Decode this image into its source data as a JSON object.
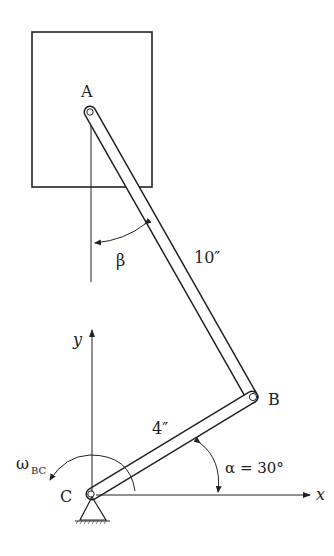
{
  "diagram": {
    "type": "mechanism",
    "points": {
      "A": {
        "label": "A"
      },
      "B": {
        "label": "B"
      },
      "C": {
        "label": "C"
      }
    },
    "links": {
      "AB": {
        "length_label": "10″"
      },
      "BC": {
        "length_label": "4″"
      }
    },
    "angles": {
      "alpha": {
        "label": "α = 30°"
      },
      "beta": {
        "label": "β"
      }
    },
    "angular_velocity": {
      "symbol": "ω",
      "subscript": "BC"
    },
    "axes": {
      "x_label": "x",
      "y_label": "y"
    },
    "colors": {
      "stroke": "#222222",
      "background": "#ffffff"
    }
  }
}
